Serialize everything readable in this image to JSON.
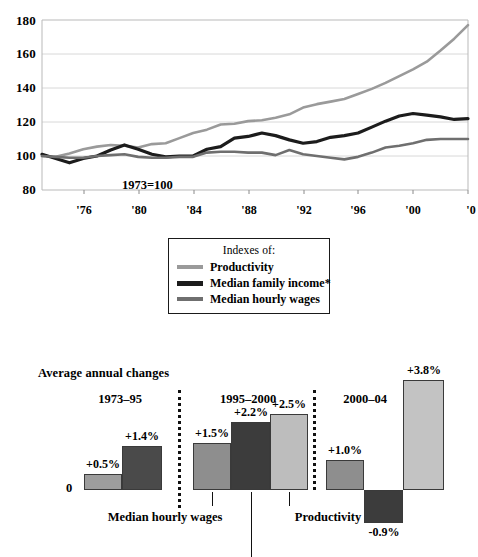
{
  "chart_data": [
    {
      "type": "line",
      "title": "",
      "annotation": "1973=100",
      "xlabel": "",
      "ylabel": "",
      "ylim": [
        80,
        180
      ],
      "ytick_labels": [
        "180",
        "160",
        "140",
        "120",
        "100",
        "80"
      ],
      "yticks": [
        180,
        160,
        140,
        120,
        100,
        80
      ],
      "xtick_labels": [
        "'76",
        "'80",
        "'84",
        "'88",
        "'92",
        "'96",
        "'00",
        "'0"
      ],
      "xticks": [
        1976,
        1980,
        1984,
        1988,
        1992,
        1996,
        2000,
        2004
      ],
      "xlim": [
        1973,
        2004
      ],
      "grid": true,
      "legend_position": "below-center",
      "legend_title": "Indexes of:",
      "series": [
        {
          "name": "Productivity",
          "color": "#9a9a9a",
          "x": [
            1973,
            1974,
            1975,
            1976,
            1977,
            1978,
            1979,
            1980,
            1981,
            1982,
            1983,
            1984,
            1985,
            1986,
            1987,
            1988,
            1989,
            1990,
            1991,
            1992,
            1993,
            1994,
            1995,
            1996,
            1997,
            1998,
            1999,
            2000,
            2001,
            2002,
            2003,
            2004
          ],
          "values": [
            100,
            99.5,
            101.5,
            104,
            105.5,
            106.5,
            106,
            105,
            107,
            107.5,
            110.5,
            113.5,
            115.5,
            118.5,
            119,
            120.5,
            121,
            122.5,
            124.5,
            128.5,
            130.5,
            132,
            133.5,
            136.5,
            139.5,
            143,
            147,
            151,
            155.5,
            162,
            169,
            177
          ]
        },
        {
          "name": "Median family income*",
          "color": "#1c1c1c",
          "x": [
            1973,
            1974,
            1975,
            1976,
            1977,
            1978,
            1979,
            1980,
            1981,
            1982,
            1983,
            1984,
            1985,
            1986,
            1987,
            1988,
            1989,
            1990,
            1991,
            1992,
            1993,
            1994,
            1995,
            1996,
            1997,
            1998,
            1999,
            2000,
            2001,
            2002,
            2003,
            2004
          ],
          "values": [
            101,
            98.5,
            96,
            98.5,
            100,
            103.5,
            106.5,
            104,
            101,
            99.5,
            100,
            100,
            104,
            105.5,
            110.5,
            111.5,
            113.5,
            112,
            109.5,
            107.5,
            108.5,
            111,
            112,
            113.5,
            117,
            120.5,
            123.5,
            125,
            124,
            123,
            121.5,
            122
          ]
        },
        {
          "name": "Median hourly wages",
          "color": "#6f6f6f",
          "x": [
            1973,
            1974,
            1975,
            1976,
            1977,
            1978,
            1979,
            1980,
            1981,
            1982,
            1983,
            1984,
            1985,
            1986,
            1987,
            1988,
            1989,
            1990,
            1991,
            1992,
            1993,
            1994,
            1995,
            1996,
            1997,
            1998,
            1999,
            2000,
            2001,
            2002,
            2003,
            2004
          ],
          "values": [
            100,
            99.5,
            99,
            99,
            100,
            100.5,
            101,
            99.5,
            99,
            99,
            99.5,
            99.5,
            102,
            102.5,
            102.5,
            102,
            102,
            100.5,
            103.5,
            101,
            100,
            99,
            98,
            99.5,
            102,
            105,
            106,
            107.5,
            109.5,
            110,
            110,
            110
          ]
        }
      ]
    },
    {
      "type": "bar",
      "title": "Average annual changes",
      "ylabel": "",
      "zero_label": "0",
      "groups": [
        {
          "label": "1973–95",
          "bars": [
            {
              "series": "Median hourly wages",
              "value": 0.5,
              "value_label": "+0.5%",
              "color": "#9d9d9d"
            },
            {
              "series": "Median family income*",
              "value": 1.4,
              "value_label": "+1.4%",
              "color": "#4a4a4a"
            }
          ]
        },
        {
          "label": "1995–2000",
          "bars": [
            {
              "series": "Median hourly wages",
              "value": 1.5,
              "value_label": "+1.5%",
              "color": "#8e8e8e"
            },
            {
              "series": "Median family income*",
              "value": 2.2,
              "value_label": "+2.2%",
              "color": "#3c3c3c"
            },
            {
              "series": "Productivity",
              "value": 2.5,
              "value_label": "+2.5%",
              "color": "#bdbdbd"
            }
          ]
        },
        {
          "label": "2000–04",
          "bars": [
            {
              "series": "Median hourly wages",
              "value": 1.0,
              "value_label": "+1.0%",
              "color": "#8e8e8e"
            },
            {
              "series": "Median family income*",
              "value": -0.9,
              "value_label": "-0.9%",
              "color": "#3c3c3c"
            },
            {
              "series": "Productivity",
              "value": 3.8,
              "value_label": "+3.8%",
              "color": "#c3c3c3"
            }
          ]
        }
      ],
      "callouts": [
        {
          "text": "Median hourly wages"
        },
        {
          "text": "Productivity"
        }
      ]
    }
  ],
  "linechart": {
    "y_ticks": [
      "180",
      "160",
      "140",
      "120",
      "100",
      "80"
    ],
    "x_ticks": [
      "'76",
      "'80",
      "'84",
      "'88",
      "'92",
      "'96",
      "'00",
      "'0"
    ],
    "annotation": "1973=100"
  },
  "legend": {
    "title": "Indexes of:",
    "items": [
      {
        "label": "Productivity",
        "color": "#9a9a9a"
      },
      {
        "label": "Median family income*",
        "color": "#1c1c1c"
      },
      {
        "label": "Median hourly wages",
        "color": "#6f6f6f"
      }
    ]
  },
  "barchart": {
    "heading": "Average annual changes",
    "zero_label": "0",
    "groups": [
      {
        "label": "1973–95"
      },
      {
        "label": "1995–2000"
      },
      {
        "label": "2000–04"
      }
    ],
    "values": {
      "g1b1": "+0.5%",
      "g1b2": "+1.4%",
      "g2b1": "+1.5%",
      "g2b2": "+2.2%",
      "g2b3": "+2.5%",
      "g3b1": "+1.0%",
      "g3b2": "-0.9%",
      "g3b3": "+3.8%"
    },
    "callouts": {
      "wages": "Median hourly wages",
      "productivity": "Productivity"
    }
  }
}
